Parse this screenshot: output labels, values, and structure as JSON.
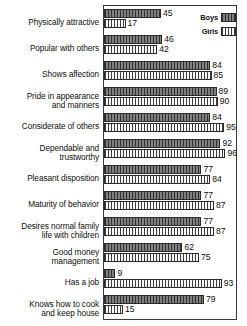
{
  "chart_data": {
    "type": "bar",
    "title": "",
    "subtitle": "",
    "xlabel": "",
    "ylabel": "",
    "orientation": "horizontal",
    "grid": false,
    "legend_position": "top-right",
    "xlim": [
      0,
      100
    ],
    "categories": [
      "Physically attractive",
      "Popular with others",
      "Shows affection",
      "Pride in appearance\nand manners",
      "Considerate of others",
      "Dependable and\ntrustworthy",
      "Pleasant disposition",
      "Maturity of behavior",
      "Desires normal family\nlife with children",
      "Good money\nmanagement",
      "Has a job",
      "Knows how to cook\nand keep house"
    ],
    "series": [
      {
        "name": "Boys",
        "swatch": "boys-swatch",
        "values": [
          45,
          46,
          84,
          89,
          84,
          92,
          77,
          77,
          77,
          62,
          9,
          79
        ]
      },
      {
        "name": "Girls",
        "swatch": "girls-swatch",
        "values": [
          17,
          42,
          85,
          90,
          95,
          96,
          84,
          87,
          87,
          75,
          93,
          15
        ]
      }
    ]
  },
  "legend": {
    "entries": [
      {
        "label": "Boys"
      },
      {
        "label": "Girls"
      }
    ]
  }
}
